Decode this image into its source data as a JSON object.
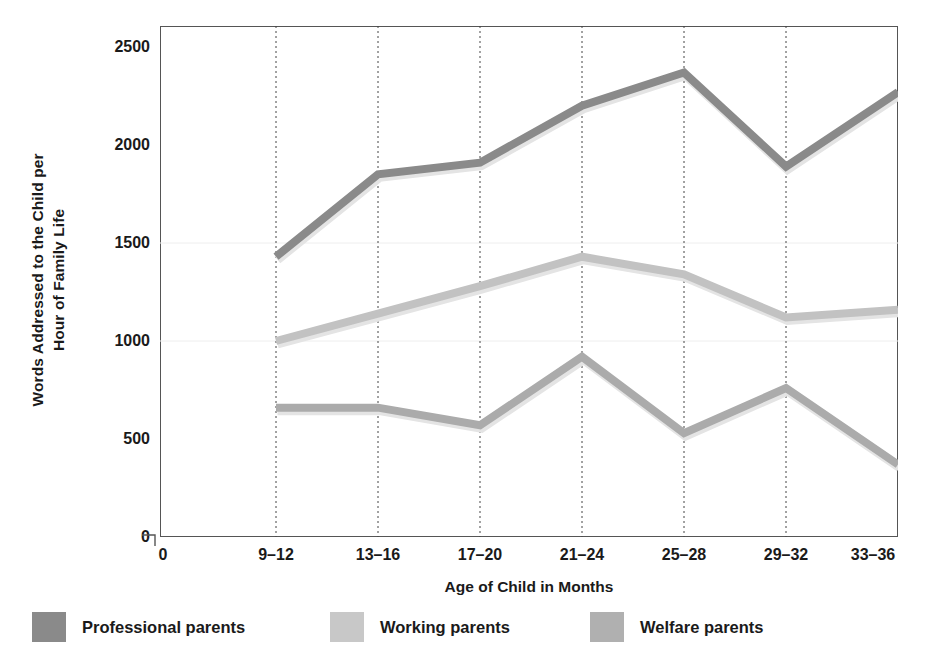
{
  "chart_data": {
    "type": "line",
    "title": "",
    "xlabel": "Age of Child in Months",
    "ylabel": "Words Addressed to the Child per Hour of Family Life",
    "ylabel_lines": [
      "Words Addressed to the Child per",
      "Hour of Family Life"
    ],
    "categories": [
      "9–12",
      "13–16",
      "17–20",
      "21–24",
      "25–28",
      "29–32",
      "33–36"
    ],
    "xtick_labels": [
      "0",
      "9–12",
      "13–16",
      "17–20",
      "21–24",
      "25–28",
      "29–32",
      "33–36"
    ],
    "ytick_labels": [
      "0",
      "500",
      "1000",
      "1500",
      "2000",
      "2500"
    ],
    "yticks": [
      0,
      500,
      1000,
      1500,
      2000,
      2500
    ],
    "ylim": [
      0,
      2600
    ],
    "grid": "vertical-dashed",
    "legend_position": "bottom",
    "series": [
      {
        "name": "Professional parents",
        "color": "#8a8a8a",
        "values": [
          1430,
          1850,
          1910,
          2200,
          2370,
          1890,
          2270
        ]
      },
      {
        "name": "Working parents",
        "color": "#c2c2c2",
        "values": [
          1000,
          1140,
          1280,
          1430,
          1340,
          1120,
          1160
        ]
      },
      {
        "name": "Welfare parents",
        "color": "#ababab",
        "values": [
          660,
          660,
          570,
          920,
          530,
          760,
          370
        ]
      }
    ]
  },
  "legend": {
    "items": [
      {
        "label": "Professional parents",
        "color": "#8a8a8a"
      },
      {
        "label": "Working parents",
        "color": "#c8c8c8"
      },
      {
        "label": "Welfare parents",
        "color": "#b0b0b0"
      }
    ]
  },
  "colors": {
    "axis": "#555555",
    "gridline": "#444444",
    "background": "#ffffff",
    "text": "#1a1a1a"
  }
}
